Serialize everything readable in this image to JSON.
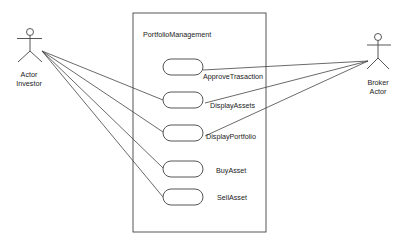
{
  "diagram": {
    "type": "uml-use-case",
    "system": {
      "label": "PortfolioManagement"
    },
    "actors": [
      {
        "id": "investor",
        "label_line1": "Actor",
        "label_line2": "Investor"
      },
      {
        "id": "broker",
        "label_line1": "Broker",
        "label_line2": "Actor"
      }
    ],
    "use_cases": [
      {
        "id": "approve",
        "label": "ApproveTrasaction"
      },
      {
        "id": "display_assets",
        "label": "DisplayAssets"
      },
      {
        "id": "display_portfolio",
        "label": "DisplayPortfolio"
      },
      {
        "id": "buy",
        "label": "BuyAsset"
      },
      {
        "id": "sell",
        "label": "SellAsset"
      }
    ],
    "associations": [
      {
        "from": "investor",
        "to": "approve"
      },
      {
        "from": "investor",
        "to": "display_assets"
      },
      {
        "from": "investor",
        "to": "display_portfolio"
      },
      {
        "from": "investor",
        "to": "buy"
      },
      {
        "from": "investor",
        "to": "sell"
      },
      {
        "from": "broker",
        "to": "approve"
      },
      {
        "from": "broker",
        "to": "display_assets"
      },
      {
        "from": "broker",
        "to": "display_portfolio"
      }
    ],
    "colors": {
      "line": "#333333",
      "background": "#ffffff"
    }
  }
}
